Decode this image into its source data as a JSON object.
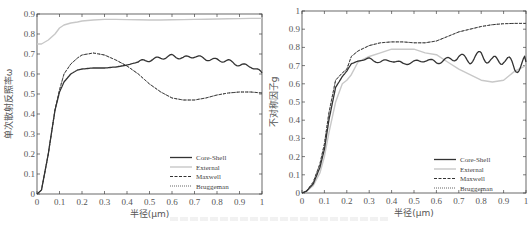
{
  "chart_data": [
    {
      "type": "line",
      "title": "",
      "xlabel": "半径(μm)",
      "ylabel": "单次散射反照率ω",
      "xlim": [
        0,
        1
      ],
      "ylim": [
        0,
        0.9
      ],
      "xticks": [
        "0",
        "0.1",
        "0.2",
        "0.3",
        "0.4",
        "0.5",
        "0.6",
        "0.7",
        "0.8",
        "0.9",
        "1"
      ],
      "yticks": [
        "0",
        "0.1",
        "0.2",
        "0.3",
        "0.4",
        "0.5",
        "0.6",
        "0.7",
        "0.8",
        "0.9"
      ],
      "grid": false,
      "legend_position": "lower right",
      "x": [
        0,
        0.02,
        0.05,
        0.08,
        0.1,
        0.12,
        0.15,
        0.18,
        0.2,
        0.25,
        0.3,
        0.35,
        0.4,
        0.45,
        0.5,
        0.55,
        0.6,
        0.65,
        0.7,
        0.75,
        0.8,
        0.85,
        0.9,
        0.95,
        1.0
      ],
      "series": [
        {
          "name": "Core-Shell",
          "style": "solid-dark",
          "values": [
            0,
            0.02,
            0.2,
            0.42,
            0.51,
            0.56,
            0.6,
            0.62,
            0.625,
            0.63,
            0.63,
            0.635,
            0.645,
            0.66,
            0.67,
            0.68,
            0.69,
            0.68,
            0.69,
            0.675,
            0.67,
            0.665,
            0.645,
            0.64,
            0.605
          ]
        },
        {
          "name": "External",
          "style": "solid-light",
          "values": [
            0.75,
            0.75,
            0.77,
            0.8,
            0.83,
            0.845,
            0.855,
            0.86,
            0.865,
            0.87,
            0.873,
            0.873,
            0.872,
            0.871,
            0.87,
            0.87,
            0.871,
            0.872,
            0.873,
            0.874,
            0.875,
            0.876,
            0.877,
            0.878,
            0.878
          ]
        },
        {
          "name": "Maxwell",
          "style": "dashed",
          "values": [
            0,
            0.02,
            0.2,
            0.42,
            0.52,
            0.6,
            0.65,
            0.68,
            0.695,
            0.705,
            0.695,
            0.67,
            0.64,
            0.6,
            0.55,
            0.51,
            0.48,
            0.47,
            0.47,
            0.48,
            0.495,
            0.505,
            0.51,
            0.51,
            0.505
          ]
        },
        {
          "name": "Bruggeman",
          "style": "dotted",
          "values": [
            0,
            0.02,
            0.2,
            0.42,
            0.52,
            0.6,
            0.65,
            0.68,
            0.695,
            0.705,
            0.695,
            0.67,
            0.64,
            0.6,
            0.55,
            0.51,
            0.48,
            0.47,
            0.47,
            0.48,
            0.495,
            0.505,
            0.51,
            0.51,
            0.505
          ]
        }
      ]
    },
    {
      "type": "line",
      "title": "",
      "xlabel": "半径(μm)",
      "ylabel": "不对称因子g",
      "xlim": [
        0,
        1
      ],
      "ylim": [
        0,
        1
      ],
      "xticks": [
        "0",
        "0.1",
        "0.2",
        "0.3",
        "0.4",
        "0.5",
        "0.6",
        "0.7",
        "0.8",
        "0.9",
        "1"
      ],
      "yticks": [
        "0",
        "0.1",
        "0.2",
        "0.3",
        "0.4",
        "0.5",
        "0.6",
        "0.7",
        "0.8",
        "0.9",
        "1"
      ],
      "grid": false,
      "legend_position": "lower right",
      "x": [
        0,
        0.02,
        0.05,
        0.08,
        0.1,
        0.12,
        0.15,
        0.18,
        0.2,
        0.22,
        0.25,
        0.3,
        0.35,
        0.4,
        0.45,
        0.5,
        0.55,
        0.6,
        0.65,
        0.7,
        0.75,
        0.8,
        0.85,
        0.9,
        0.95,
        1.0
      ],
      "series": [
        {
          "name": "Core-Shell",
          "style": "solid-dark",
          "values": [
            0,
            0.01,
            0.05,
            0.14,
            0.24,
            0.4,
            0.58,
            0.64,
            0.67,
            0.71,
            0.725,
            0.735,
            0.72,
            0.73,
            0.71,
            0.72,
            0.73,
            0.72,
            0.73,
            0.75,
            0.73,
            0.76,
            0.72,
            0.74,
            0.69,
            0.72
          ]
        },
        {
          "name": "External",
          "style": "solid-light",
          "values": [
            0,
            0.01,
            0.04,
            0.11,
            0.2,
            0.33,
            0.5,
            0.6,
            0.62,
            0.65,
            0.72,
            0.75,
            0.77,
            0.79,
            0.79,
            0.79,
            0.77,
            0.76,
            0.72,
            0.68,
            0.65,
            0.62,
            0.61,
            0.62,
            0.67,
            0.7
          ]
        },
        {
          "name": "Maxwell",
          "style": "dashed",
          "values": [
            0,
            0.01,
            0.06,
            0.16,
            0.27,
            0.44,
            0.62,
            0.66,
            0.68,
            0.75,
            0.78,
            0.81,
            0.825,
            0.83,
            0.83,
            0.825,
            0.825,
            0.835,
            0.86,
            0.885,
            0.9,
            0.915,
            0.925,
            0.93,
            0.932,
            0.932
          ]
        },
        {
          "name": "Bruggeman",
          "style": "dotted",
          "values": [
            0,
            0.01,
            0.06,
            0.16,
            0.27,
            0.44,
            0.62,
            0.66,
            0.68,
            0.75,
            0.78,
            0.81,
            0.825,
            0.83,
            0.83,
            0.825,
            0.825,
            0.835,
            0.86,
            0.885,
            0.9,
            0.915,
            0.925,
            0.93,
            0.932,
            0.932
          ]
        }
      ]
    }
  ],
  "left_chart": {
    "ylabel": "单次散射反照率ω",
    "xlabel": "半径(μm)",
    "legend": [
      "Core-Shell",
      "External",
      "Maxwell",
      "Bruggeman"
    ]
  },
  "right_chart": {
    "ylabel": "不对称因子g",
    "xlabel": "半径(μm)",
    "legend": [
      "Core-Shell",
      "External",
      "Maxwell",
      "Bruggeman"
    ]
  },
  "colors": {
    "core_shell": "#333333",
    "external": "#c8c8c8",
    "maxwell": "#333333",
    "bruggeman": "#555555",
    "axis": "#444444"
  }
}
